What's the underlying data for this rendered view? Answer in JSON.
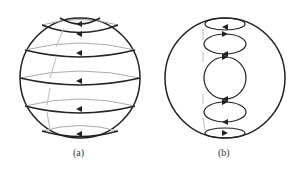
{
  "figure": {
    "panels": [
      {
        "id": "a",
        "label": "(a)",
        "description": "Sphere with latitude circulation loops (arrows pointing left), gray dashed meridional arrows"
      },
      {
        "id": "b",
        "label": "(b)",
        "description": "Sphere with stacked closed vertical circulation cells along the axis"
      }
    ]
  },
  "colors": {
    "stroke": "#222222",
    "faint": "#aaaaaa",
    "background": "#ffffff"
  }
}
